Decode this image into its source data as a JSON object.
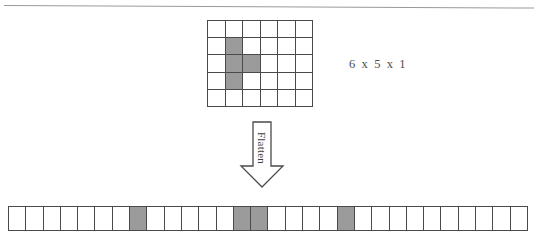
{
  "diagram": {
    "colors": {
      "active_cell": "#9b9b9b",
      "inactive_cell": "#ffffff",
      "border": "#4a4a4a",
      "background": "#ffffff",
      "text": "#4d4d4d",
      "rule": "#9a9a9a"
    },
    "grid": {
      "name": "input-feature-map",
      "columns": 6,
      "rows": 5,
      "depth": 1,
      "dimension_label": "6 x 5 x 1",
      "active_cells": [
        {
          "row": 1,
          "col": 1
        },
        {
          "row": 2,
          "col": 1
        },
        {
          "row": 2,
          "col": 2
        },
        {
          "row": 3,
          "col": 1
        }
      ],
      "cells": [
        [
          0,
          0,
          0,
          0,
          0,
          0
        ],
        [
          0,
          1,
          0,
          0,
          0,
          0
        ],
        [
          0,
          1,
          1,
          0,
          0,
          0
        ],
        [
          0,
          1,
          0,
          0,
          0,
          0
        ],
        [
          0,
          0,
          0,
          0,
          0,
          0
        ]
      ]
    },
    "arrow": {
      "label": "Flatten",
      "direction": "down"
    },
    "strip": {
      "name": "flattened-vector",
      "length": 30,
      "active_indices": [
        7,
        13,
        14,
        19
      ],
      "cells": [
        0,
        0,
        0,
        0,
        0,
        0,
        0,
        1,
        0,
        0,
        0,
        0,
        0,
        1,
        1,
        0,
        0,
        0,
        0,
        1,
        0,
        0,
        0,
        0,
        0,
        0,
        0,
        0,
        0,
        0
      ]
    }
  }
}
